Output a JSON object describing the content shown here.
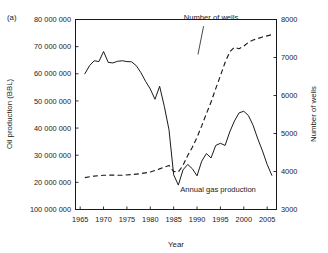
{
  "figure": {
    "panel_label": "(a)"
  },
  "chart_data": {
    "type": "line",
    "title": "",
    "xlabel": "Year",
    "ylabel": "Oil production (BBL)",
    "y2label": "Number of wells",
    "xlim": [
      1964,
      2007
    ],
    "ylim": [
      10000000,
      80000000
    ],
    "y2lim": [
      3000,
      8000
    ],
    "grid": false,
    "legend": "annotations-inline",
    "xticks": [
      1965,
      1970,
      1975,
      1980,
      1985,
      1990,
      1995,
      2000,
      2005
    ],
    "xtick_labels": [
      "1965",
      "1970",
      "1975",
      "1980",
      "1985",
      "1990",
      "1995",
      "2000",
      "2005"
    ],
    "yticks": [
      80000000,
      70000000,
      60000000,
      50000000,
      40000000,
      30000000,
      20000000,
      10000000
    ],
    "ytick_labels": [
      "80 000 000",
      "70 000 000",
      "60 000 000",
      "50 000 000",
      "40 000 000",
      "30 000 000",
      "20 000 000",
      "100 000 000"
    ],
    "y2ticks": [
      8000,
      7000,
      6000,
      5000,
      4000,
      3000
    ],
    "y2tick_labels": [
      "8000",
      "7000",
      "6000",
      "5000",
      "4000",
      "3000"
    ],
    "annotations": [
      {
        "text": "Number of wells",
        "x": 1993.0,
        "y_axis": "right",
        "y": 7980
      },
      {
        "text": "Annual gas production",
        "x": 1994.5,
        "y_axis": "left",
        "y": 16600000
      }
    ],
    "series": [
      {
        "name": "Annual gas production",
        "axis": "left",
        "style": "solid",
        "x": [
          1966,
          1967,
          1968,
          1969,
          1970,
          1971,
          1972,
          1973,
          1974,
          1975,
          1976,
          1977,
          1978,
          1979,
          1980,
          1981,
          1982,
          1983,
          1984,
          1985,
          1986,
          1987,
          1988,
          1989,
          1990,
          1991,
          1992,
          1993,
          1994,
          1995,
          1996,
          1997,
          1998,
          1999,
          2000,
          2001,
          2002,
          2003,
          2004,
          2005,
          2006
        ],
        "values": [
          60000000,
          63000000,
          64800000,
          64500000,
          68200000,
          64200000,
          64000000,
          64600000,
          64800000,
          64500000,
          64400000,
          63000000,
          60400000,
          57200000,
          54400000,
          50600000,
          55400000,
          48000000,
          39400000,
          22800000,
          19000000,
          24600000,
          26600000,
          25000000,
          22400000,
          27800000,
          30600000,
          29000000,
          33600000,
          34400000,
          33600000,
          38600000,
          42600000,
          45600000,
          46200000,
          44600000,
          41000000,
          36000000,
          31600000,
          26600000,
          22600000
        ]
      },
      {
        "name": "Number of wells",
        "axis": "right",
        "style": "dashed",
        "x": [
          1966,
          1968,
          1970,
          1972,
          1974,
          1976,
          1978,
          1980,
          1982,
          1984,
          1985,
          1986,
          1987,
          1988,
          1989,
          1990,
          1991,
          1992,
          1993,
          1994,
          1995,
          1996,
          1997,
          1998,
          1999,
          2000,
          2001,
          2002,
          2003,
          2004,
          2005,
          2006
        ],
        "values": [
          3840,
          3880,
          3900,
          3905,
          3900,
          3920,
          3945,
          3985,
          4070,
          4160,
          4000,
          3990,
          4160,
          4420,
          4640,
          4900,
          5200,
          5520,
          5830,
          6180,
          6520,
          6870,
          7150,
          7270,
          7230,
          7300,
          7400,
          7460,
          7500,
          7540,
          7570,
          7600
        ]
      }
    ]
  }
}
